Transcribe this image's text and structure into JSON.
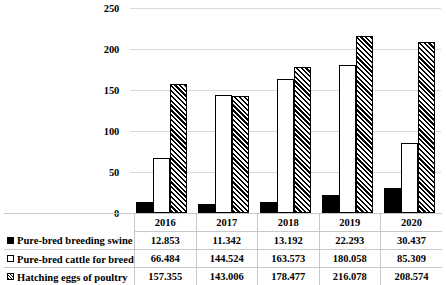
{
  "chart_data": {
    "type": "bar",
    "title": "",
    "xlabel": "",
    "ylabel": "",
    "ylim": [
      0,
      250
    ],
    "yticks": [
      0,
      50,
      100,
      150,
      200,
      250
    ],
    "grid": true,
    "legend_position": "bottom-table",
    "categories": [
      "2016",
      "2017",
      "2018",
      "2019",
      "2020"
    ],
    "series": [
      {
        "name": "Pure-bred breeding swine",
        "marker": "filled-square",
        "values": [
          12.853,
          11.342,
          13.192,
          22.293,
          30.437
        ],
        "labels": [
          "12.853",
          "11.342",
          "13.192",
          "22.293",
          "30.437"
        ]
      },
      {
        "name": "Pure-bred cattle for breeding",
        "marker": "hollow-square",
        "values": [
          66.484,
          144.524,
          163.573,
          180.058,
          85.309
        ],
        "labels": [
          "66.484",
          "144.524",
          "163.573",
          "180.058",
          "85.309"
        ]
      },
      {
        "name": "Hatching eggs of poultry",
        "marker": "hatched-square",
        "values": [
          157.355,
          143.006,
          178.477,
          216.078,
          208.574
        ],
        "labels": [
          "157.355",
          "143.006",
          "178.477",
          "216.078",
          "208.574"
        ]
      }
    ]
  },
  "colors": {
    "series_0": "#000000",
    "series_1": "#ffffff",
    "series_2": "#000000",
    "gridline": "#d9d9d9",
    "table_border": "#c8c8c8",
    "text": "#000000"
  }
}
